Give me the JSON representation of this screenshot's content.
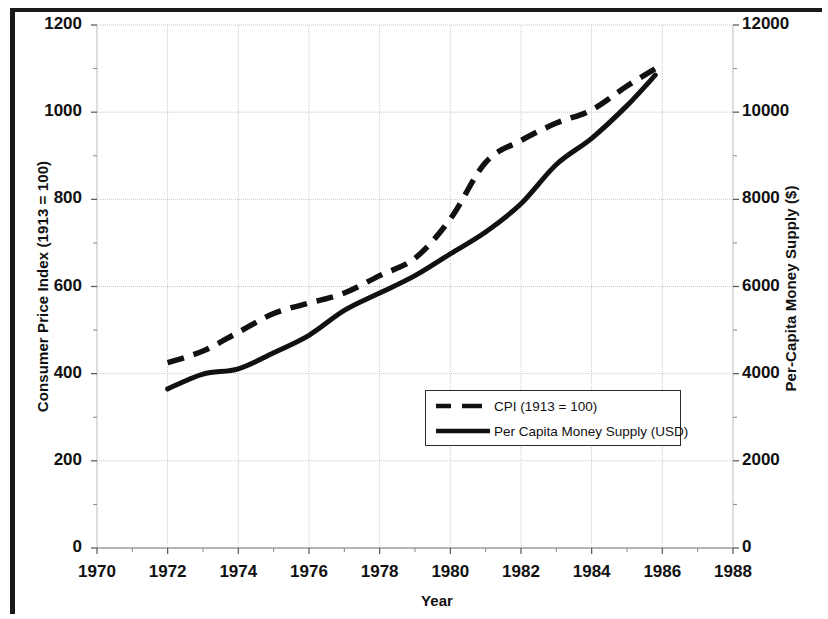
{
  "chart_data": {
    "type": "line",
    "title": "",
    "xlabel": "Year",
    "ylabel": "Consumer Price Index (1913 = 100)",
    "y2label": "Per-Capita Money Supply ($)",
    "xlim": [
      1970,
      1988
    ],
    "ylim": [
      0,
      1200
    ],
    "y2lim": [
      0,
      12000
    ],
    "xticks": [
      1970,
      1972,
      1974,
      1976,
      1978,
      1980,
      1982,
      1984,
      1986,
      1988
    ],
    "yticks": [
      0,
      200,
      400,
      600,
      800,
      1000,
      1200
    ],
    "y2ticks": [
      0,
      2000,
      4000,
      6000,
      8000,
      10000,
      12000
    ],
    "grid": true,
    "legend_position": "center",
    "series": [
      {
        "name": "CPI (1913 = 100)",
        "axis": "left",
        "style": "dashed",
        "color": "#111111",
        "x": [
          1972,
          1973,
          1974,
          1975,
          1976,
          1977,
          1978,
          1979,
          1980,
          1981,
          1982,
          1983,
          1984,
          1985,
          1985.8
        ],
        "values": [
          425,
          452,
          495,
          538,
          562,
          585,
          625,
          665,
          755,
          885,
          935,
          975,
          1005,
          1060,
          1100
        ]
      },
      {
        "name": "Per Capita Money Supply (USD)",
        "axis": "right",
        "style": "solid",
        "color": "#111111",
        "x": [
          1972,
          1973,
          1974,
          1975,
          1976,
          1977,
          1978,
          1979,
          1980,
          1981,
          1982,
          1983,
          1984,
          1985,
          1985.8
        ],
        "values": [
          3650,
          3990,
          4110,
          4480,
          4880,
          5450,
          5850,
          6250,
          6750,
          7250,
          7900,
          8800,
          9400,
          10150,
          10850
        ]
      }
    ]
  },
  "axes": {
    "left_title": "Consumer Price Index (1913 = 100)",
    "right_title": "Per-Capita Money Supply ($)",
    "x_title": "Year",
    "left_ticks": [
      "1200",
      "1000",
      "800",
      "600",
      "400",
      "200",
      "0"
    ],
    "right_ticks": [
      "12000",
      "10000",
      "8000",
      "6000",
      "4000",
      "2000",
      "0"
    ],
    "x_ticks": [
      "1970",
      "1972",
      "1974",
      "1976",
      "1978",
      "1980",
      "1982",
      "1984",
      "1986",
      "1988"
    ]
  },
  "legend": {
    "items": [
      {
        "label": "CPI (1913 = 100)",
        "style": "dashed"
      },
      {
        "label": "Per Capita Money Supply (USD)",
        "style": "solid"
      }
    ]
  },
  "colors": {
    "line": "#111111",
    "grid": "#c9c9c9",
    "frame": "#1a1a1a",
    "background": "#ffffff"
  }
}
